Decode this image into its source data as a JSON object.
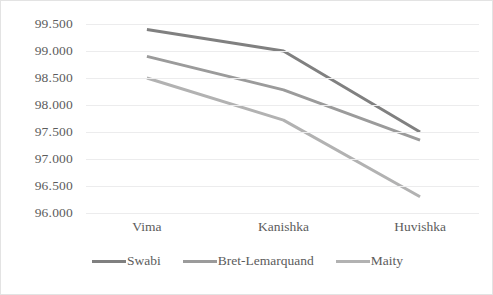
{
  "chart_data": {
    "type": "line",
    "title": "",
    "xlabel": "",
    "ylabel": "",
    "categories": [
      "Vima",
      "Kanishka",
      "Huvishka"
    ],
    "series": [
      {
        "name": "Swabi",
        "values": [
          99.4,
          99.0,
          97.5
        ],
        "color": "#808080"
      },
      {
        "name": "Bret-Lemarquand",
        "values": [
          98.9,
          98.28,
          97.35
        ],
        "color": "#9b9b9b"
      },
      {
        "name": "Maity",
        "values": [
          98.5,
          97.72,
          96.3
        ],
        "color": "#b2b2b2"
      }
    ],
    "ylim": [
      96.0,
      99.5
    ],
    "ytick_step": 0.5,
    "ytick_labels": [
      "99.500",
      "99.000",
      "98.500",
      "98.000",
      "97.500",
      "97.000",
      "96.500",
      "96.000"
    ],
    "ytick_values": [
      99.5,
      99.0,
      98.5,
      98.0,
      97.5,
      97.0,
      96.5,
      96.0
    ],
    "grid": true,
    "legend_position": "bottom",
    "border_color": "#e3e3e3",
    "grid_color": "#ececed",
    "text_color": "#5c5c5c"
  }
}
